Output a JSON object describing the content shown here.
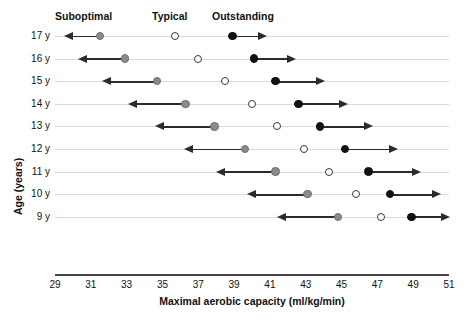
{
  "chart_data": {
    "type": "scatter",
    "title": "",
    "xlabel": "Maximal aerobic capacity (ml/kg/min)",
    "ylabel": "Age (years)",
    "xlim": [
      29,
      51
    ],
    "xticks": [
      29,
      31,
      33,
      35,
      37,
      39,
      41,
      43,
      45,
      47,
      49,
      51
    ],
    "grid": false,
    "legend_position": "top",
    "categories": [
      "17 y",
      "16 y",
      "15 y",
      "14 y",
      "13 y",
      "12 y",
      "11 y",
      "10 y",
      "9 y"
    ],
    "group_labels": [
      "Suboptimal",
      "Typical",
      "Outstanding"
    ],
    "colors": {
      "suboptimal": "#8a8a8a",
      "typical": "#ffffff",
      "outstanding": "#111111",
      "arrow": "#2b2b2b",
      "rowline": "#d9d9d9",
      "axis": "#444444"
    },
    "series": [
      {
        "name": "Suboptimal",
        "marker": "filled-gray",
        "arrow": "left",
        "values": [
          31.5,
          32.9,
          34.7,
          36.3,
          37.9,
          39.6,
          41.3,
          43.1,
          44.8
        ]
      },
      {
        "name": "Typical",
        "marker": "open",
        "arrow": "none",
        "values": [
          35.7,
          37.0,
          38.5,
          40.0,
          41.4,
          42.9,
          44.3,
          45.8,
          47.2
        ]
      },
      {
        "name": "Outstanding",
        "marker": "filled-black",
        "arrow": "right",
        "values": [
          38.9,
          40.1,
          41.3,
          42.6,
          43.8,
          45.2,
          46.5,
          47.7,
          48.9
        ]
      }
    ],
    "rows": [
      {
        "age": "17 y",
        "suboptimal": 31.5,
        "typical": 35.7,
        "outstanding": 38.9,
        "left_arrow_to": 29.5,
        "right_arrow_to": 40.8
      },
      {
        "age": "16 y",
        "suboptimal": 32.9,
        "typical": 37.0,
        "outstanding": 40.1,
        "left_arrow_to": 30.3,
        "right_arrow_to": 42.4
      },
      {
        "age": "15 y",
        "suboptimal": 34.7,
        "typical": 38.5,
        "outstanding": 41.3,
        "left_arrow_to": 31.6,
        "right_arrow_to": 44.0
      },
      {
        "age": "14 y",
        "suboptimal": 36.3,
        "typical": 40.0,
        "outstanding": 42.6,
        "left_arrow_to": 33.1,
        "right_arrow_to": 45.3
      },
      {
        "age": "13 y",
        "suboptimal": 37.9,
        "typical": 41.4,
        "outstanding": 43.8,
        "left_arrow_to": 34.6,
        "right_arrow_to": 46.7
      },
      {
        "age": "12 y",
        "suboptimal": 39.6,
        "typical": 42.9,
        "outstanding": 45.2,
        "left_arrow_to": 36.2,
        "right_arrow_to": 48.1
      },
      {
        "age": "11 y",
        "suboptimal": 41.3,
        "typical": 44.3,
        "outstanding": 46.5,
        "left_arrow_to": 38.0,
        "right_arrow_to": 49.4
      },
      {
        "age": "10 y",
        "suboptimal": 43.1,
        "typical": 45.8,
        "outstanding": 47.7,
        "left_arrow_to": 39.7,
        "right_arrow_to": 50.5
      },
      {
        "age": "9 y",
        "suboptimal": 44.8,
        "typical": 47.2,
        "outstanding": 48.9,
        "left_arrow_to": 41.4,
        "right_arrow_to": 51.0
      }
    ]
  },
  "header": {
    "suboptimal_label": "Suboptimal",
    "typical_label": "Typical",
    "outstanding_label": "Outstanding"
  },
  "axes": {
    "y_title": "Age (years)",
    "x_title": "Maximal aerobic capacity (ml/kg/min)"
  }
}
